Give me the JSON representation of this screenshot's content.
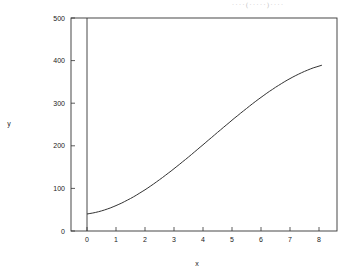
{
  "header_fragment": "· · · ·  ( ·  ·  · · · ) ·  · · ·",
  "chart_data": {
    "type": "line",
    "title": "",
    "xlabel": "x",
    "ylabel": "y",
    "xlim": [
      -0.55,
      8.6
    ],
    "ylim": [
      0,
      500
    ],
    "grid": false,
    "legend": null,
    "x_ticks": [
      0,
      1,
      2,
      3,
      4,
      5,
      6,
      7,
      8
    ],
    "x_tick_labels": [
      "0",
      "1",
      "2",
      "3",
      "4",
      "5",
      "6",
      "7",
      "8"
    ],
    "y_ticks": [
      0,
      100,
      200,
      300,
      400,
      500
    ],
    "y_tick_labels": [
      "0",
      "100",
      "200",
      "300",
      "400",
      "500"
    ],
    "annotations": [
      {
        "type": "vertical_line",
        "x": 0,
        "from_y": 0,
        "to_y": 500
      }
    ],
    "series": [
      {
        "name": "y",
        "x": [
          0,
          0.5,
          1,
          1.5,
          2,
          2.5,
          3,
          3.5,
          4,
          4.5,
          5,
          5.5,
          6,
          6.5,
          7,
          7.5,
          8,
          8.1
        ],
        "y": [
          18,
          30,
          45,
          63,
          85,
          109,
          136,
          164,
          193,
          222,
          250,
          278,
          304,
          329,
          351,
          370,
          385,
          427
        ]
      }
    ],
    "colors": {
      "line": "#333333",
      "axis": "#333333",
      "background": "#ffffff"
    }
  }
}
